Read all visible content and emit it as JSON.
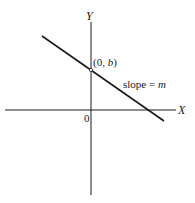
{
  "diagram": {
    "axes": {
      "x_label": "X",
      "y_label": "Y",
      "origin_label": "0"
    },
    "point": {
      "label_prefix": "(0, ",
      "label_var": "b",
      "label_suffix": ")"
    },
    "line": {
      "label_text": "slope = ",
      "label_var": "m"
    },
    "colors": {
      "ink": "#1a1a1a",
      "background": "#ffffff"
    }
  }
}
